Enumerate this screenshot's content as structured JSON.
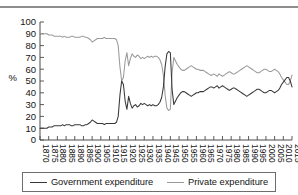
{
  "figure": {
    "has_top_rule": true,
    "percent_axis_label": "%"
  },
  "legend": {
    "government_label": "Government expenditure",
    "private_label": "Private expenditure",
    "government_color": "#383838",
    "private_color": "#9a9a9a"
  },
  "chart_data": {
    "type": "line",
    "title": "",
    "xlabel": "",
    "ylabel": "%",
    "ylim": [
      0,
      100
    ],
    "ytick_values": [
      0,
      10,
      20,
      30,
      40,
      50,
      60,
      70,
      80,
      90,
      100
    ],
    "ytick_labels": [
      "0",
      "10",
      "20",
      "30",
      "40",
      "50",
      "60",
      "70",
      "80",
      "90",
      "100"
    ],
    "xlim": [
      1870,
      2015
    ],
    "xtick_labels": [
      "1870",
      "1875",
      "1880",
      "1885",
      "1890",
      "1895",
      "1900",
      "1905",
      "1910",
      "1915",
      "1920",
      "1925",
      "1930",
      "1935",
      "1940",
      "1945",
      "1950",
      "1955",
      "1960",
      "1965",
      "1970",
      "1975",
      "1980",
      "1985",
      "1990",
      "1995",
      "2000",
      "2005",
      "2010",
      "2015"
    ],
    "grid": false,
    "legend_position": "bottom",
    "x": [
      1870,
      1871,
      1872,
      1873,
      1874,
      1875,
      1876,
      1877,
      1878,
      1879,
      1880,
      1881,
      1882,
      1883,
      1884,
      1885,
      1886,
      1887,
      1888,
      1889,
      1890,
      1891,
      1892,
      1893,
      1894,
      1895,
      1896,
      1897,
      1898,
      1899,
      1900,
      1901,
      1902,
      1903,
      1904,
      1905,
      1906,
      1907,
      1908,
      1909,
      1910,
      1911,
      1912,
      1913,
      1914,
      1915,
      1916,
      1917,
      1918,
      1919,
      1920,
      1921,
      1922,
      1923,
      1924,
      1925,
      1926,
      1927,
      1928,
      1929,
      1930,
      1931,
      1932,
      1933,
      1934,
      1935,
      1936,
      1937,
      1938,
      1939,
      1940,
      1941,
      1942,
      1943,
      1944,
      1945,
      1946,
      1947,
      1948,
      1949,
      1950,
      1951,
      1952,
      1953,
      1954,
      1955,
      1956,
      1957,
      1958,
      1959,
      1960,
      1961,
      1962,
      1963,
      1964,
      1965,
      1966,
      1967,
      1968,
      1969,
      1970,
      1971,
      1972,
      1973,
      1974,
      1975,
      1976,
      1977,
      1978,
      1979,
      1980,
      1981,
      1982,
      1983,
      1984,
      1985,
      1986,
      1987,
      1988,
      1989,
      1990,
      1991,
      1992,
      1993,
      1994,
      1995,
      1996,
      1997,
      1998,
      1999,
      2000,
      2001,
      2002,
      2003,
      2004,
      2005,
      2006,
      2007,
      2008,
      2009,
      2010,
      2011,
      2012,
      2013,
      2014,
      2015
    ],
    "series": [
      {
        "name": "Government expenditure",
        "color": "#383838",
        "values": [
          10,
          10,
          10,
          10,
          10,
          11,
          11,
          11,
          12,
          12,
          12,
          12,
          12,
          13,
          12,
          13,
          13,
          13,
          12,
          12,
          13,
          13,
          13,
          13,
          12,
          12,
          13,
          13,
          14,
          15,
          17,
          16,
          15,
          14,
          14,
          14,
          14,
          13,
          14,
          14,
          14,
          14,
          14,
          14,
          15,
          20,
          38,
          50,
          47,
          33,
          26,
          37,
          31,
          27,
          29,
          30,
          28,
          29,
          31,
          30,
          31,
          30,
          29,
          30,
          29,
          30,
          29,
          29,
          30,
          32,
          36,
          45,
          62,
          73,
          75,
          74,
          43,
          30,
          33,
          36,
          38,
          40,
          41,
          41,
          40,
          39,
          38,
          37,
          38,
          39,
          40,
          40,
          41,
          41,
          41,
          42,
          43,
          44,
          45,
          45,
          44,
          45,
          46,
          44,
          45,
          46,
          45,
          44,
          43,
          42,
          43,
          44,
          44,
          43,
          42,
          41,
          40,
          39,
          38,
          37,
          38,
          39,
          40,
          41,
          42,
          43,
          43,
          42,
          41,
          40,
          40,
          41,
          42,
          42,
          41,
          40,
          41,
          42,
          44,
          47,
          49,
          51,
          53,
          53,
          50,
          45
        ],
        "marker": "none",
        "linewidth": 1.05
      },
      {
        "name": "Private expenditure",
        "color": "#9a9a9a",
        "values": [
          90,
          90,
          90,
          90,
          90,
          89,
          89,
          89,
          88,
          88,
          88,
          88,
          88,
          87,
          88,
          87,
          87,
          87,
          88,
          88,
          87,
          87,
          87,
          87,
          88,
          88,
          87,
          87,
          86,
          85,
          83,
          84,
          85,
          86,
          86,
          86,
          86,
          87,
          86,
          86,
          86,
          86,
          86,
          86,
          85,
          80,
          62,
          50,
          53,
          67,
          74,
          63,
          69,
          73,
          71,
          70,
          72,
          71,
          69,
          70,
          69,
          70,
          71,
          70,
          71,
          70,
          71,
          71,
          70,
          68,
          64,
          55,
          38,
          27,
          25,
          26,
          57,
          70,
          67,
          64,
          62,
          60,
          59,
          59,
          60,
          61,
          62,
          63,
          62,
          61,
          60,
          60,
          59,
          59,
          59,
          58,
          57,
          56,
          55,
          55,
          56,
          55,
          54,
          56,
          55,
          54,
          55,
          56,
          57,
          58,
          57,
          56,
          56,
          57,
          58,
          59,
          60,
          61,
          62,
          63,
          62,
          61,
          60,
          59,
          58,
          57,
          57,
          58,
          59,
          60,
          60,
          59,
          58,
          58,
          59,
          60,
          59,
          58,
          56,
          53,
          51,
          49,
          47,
          47,
          50,
          55
        ],
        "marker": "none",
        "linewidth": 1.05
      }
    ],
    "annotations": [
      {
        "period": "1870-1913",
        "note": "Private ~86-90%, Government ~10-15%"
      },
      {
        "period": "1916-1918",
        "note": "WWI: Government spikes to ~50%"
      },
      {
        "period": "1920-1939",
        "note": "Interwar: Private ~70%, Government ~30%"
      },
      {
        "period": "1942-1945",
        "note": "WWII: Government peaks ~75%, Private ~25%"
      },
      {
        "period": "1950-2008",
        "note": "Private ~55-63%, Government ~37-46%"
      },
      {
        "period": "2012",
        "note": "Series cross; Government ends above Private"
      }
    ]
  }
}
